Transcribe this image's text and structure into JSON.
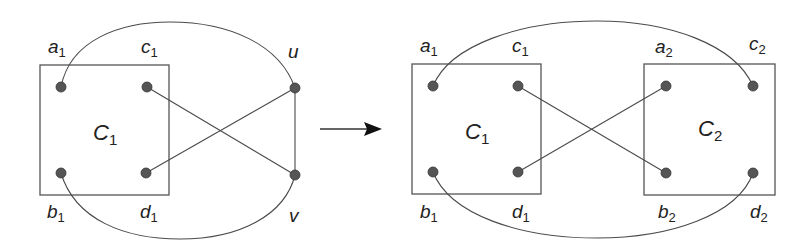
{
  "diagram": {
    "colors": {
      "stroke": "#4a4a4a",
      "node_fill": "#555555",
      "text": "#222222",
      "background": "#ffffff"
    },
    "left": {
      "component": {
        "name": "C",
        "sub": "1"
      },
      "nodes": [
        {
          "id": "a1",
          "name": "a",
          "sub": "1"
        },
        {
          "id": "c1",
          "name": "c",
          "sub": "1"
        },
        {
          "id": "b1",
          "name": "b",
          "sub": "1"
        },
        {
          "id": "d1",
          "name": "d",
          "sub": "1"
        },
        {
          "id": "u",
          "name": "u",
          "sub": ""
        },
        {
          "id": "v",
          "name": "v",
          "sub": ""
        }
      ],
      "edges": [
        [
          "a1",
          "u"
        ],
        [
          "c1",
          "v"
        ],
        [
          "d1",
          "u"
        ],
        [
          "b1",
          "v"
        ],
        [
          "u",
          "v"
        ]
      ]
    },
    "arrow": {
      "direction": "right"
    },
    "right": {
      "components": [
        {
          "name": "C",
          "sub": "1"
        },
        {
          "name": "C",
          "sub": "2"
        }
      ],
      "nodes": [
        {
          "id": "a1",
          "name": "a",
          "sub": "1"
        },
        {
          "id": "c1",
          "name": "c",
          "sub": "1"
        },
        {
          "id": "b1",
          "name": "b",
          "sub": "1"
        },
        {
          "id": "d1",
          "name": "d",
          "sub": "1"
        },
        {
          "id": "a2",
          "name": "a",
          "sub": "2"
        },
        {
          "id": "c2",
          "name": "c",
          "sub": "2"
        },
        {
          "id": "b2",
          "name": "b",
          "sub": "2"
        },
        {
          "id": "d2",
          "name": "d",
          "sub": "2"
        }
      ],
      "edges": [
        [
          "a1",
          "c2"
        ],
        [
          "c1",
          "b2"
        ],
        [
          "d1",
          "a2"
        ],
        [
          "b1",
          "d2"
        ]
      ]
    }
  }
}
